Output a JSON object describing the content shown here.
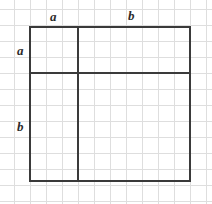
{
  "figure": {
    "canvas": {
      "width": 212,
      "height": 204,
      "background": "#ffffff"
    },
    "colors": {
      "outline": "#3a3a3a",
      "divider": "#3a3a3a",
      "grid_major": "#d9d9d9",
      "grid_minor": "#ededed",
      "label_text": "#2b2b2b"
    },
    "grid": {
      "spacing_px": 16,
      "origin_x": 30,
      "origin_y": 25,
      "vertical_lines_x": [
        14,
        30,
        46,
        62,
        78,
        94,
        110,
        126,
        142,
        158,
        174,
        190,
        206
      ],
      "horizontal_lines_y": [
        9,
        25,
        41,
        57,
        73,
        89,
        105,
        121,
        137,
        153,
        169,
        185,
        201
      ]
    },
    "square": {
      "left": 30,
      "top": 27,
      "right": 190,
      "bottom": 181,
      "width": 160,
      "height": 154,
      "stroke_width": 2
    },
    "dividers": {
      "vertical_x": 78,
      "horizontal_y": 73,
      "stroke_width": 2
    },
    "labels": [
      {
        "id": "top-a",
        "text": "a",
        "x": 50,
        "y": 10,
        "side": "top",
        "segment": "a"
      },
      {
        "id": "top-b",
        "text": "b",
        "x": 128,
        "y": 9,
        "side": "top",
        "segment": "b"
      },
      {
        "id": "left-a",
        "text": "a",
        "x": 17,
        "y": 44,
        "side": "left",
        "segment": "a"
      },
      {
        "id": "left-b",
        "text": "b",
        "x": 17,
        "y": 120,
        "side": "left",
        "segment": "b"
      }
    ],
    "regions": [
      {
        "id": "region-a-squared",
        "label": "a × a",
        "x": 30,
        "y": 27,
        "w": 48,
        "h": 46
      },
      {
        "id": "region-ab-top-right",
        "label": "b × a",
        "x": 78,
        "y": 27,
        "w": 112,
        "h": 46
      },
      {
        "id": "region-ab-bottom-left",
        "label": "a × b",
        "x": 30,
        "y": 73,
        "w": 48,
        "h": 108
      },
      {
        "id": "region-b-squared",
        "label": "b × b",
        "x": 78,
        "y": 73,
        "w": 112,
        "h": 108
      }
    ]
  }
}
